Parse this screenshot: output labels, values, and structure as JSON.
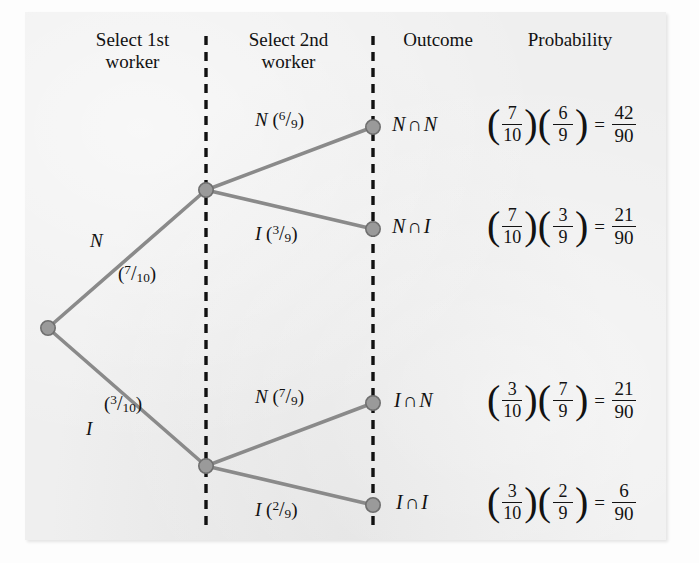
{
  "figure": {
    "type": "probability-tree-diagram",
    "headers": [
      {
        "id": "select-1st-worker",
        "line1": "Select 1st",
        "line2": "worker"
      },
      {
        "id": "select-2nd-worker",
        "line1": "Select 2nd",
        "line2": "worker"
      },
      {
        "id": "outcome",
        "line1": "Outcome",
        "line2": ""
      },
      {
        "id": "probability",
        "line1": "Probability",
        "line2": ""
      }
    ],
    "colors": {
      "panel_background": "#efefef",
      "page_background": "#fdfdfd",
      "branch_line": "#8a8a8a",
      "node_fill": "#9a9a9a",
      "node_stroke": "#6f6f6f",
      "divider": "#111111",
      "text": "#121212"
    },
    "dividers": [
      {
        "id": "divider-1",
        "x": 206,
        "style": "dashed"
      },
      {
        "id": "divider-2",
        "x": 373,
        "style": "dashed"
      }
    ],
    "nodes": [
      {
        "id": "root",
        "x": 48,
        "y": 328
      },
      {
        "id": "lvl1-n",
        "x": 206,
        "y": 190
      },
      {
        "id": "lvl1-i",
        "x": 206,
        "y": 466
      },
      {
        "id": "leaf-nn",
        "x": 373,
        "y": 127
      },
      {
        "id": "leaf-ni",
        "x": 373,
        "y": 229
      },
      {
        "id": "leaf-in",
        "x": 373,
        "y": 403
      },
      {
        "id": "leaf-ii",
        "x": 373,
        "y": 505
      }
    ],
    "branches": {
      "level1": [
        {
          "id": "branch-n",
          "event": "N",
          "prob_num": "7",
          "prob_den": "10",
          "from": "root",
          "to": "lvl1-n"
        },
        {
          "id": "branch-i",
          "event": "I",
          "prob_num": "3",
          "prob_den": "10",
          "from": "root",
          "to": "lvl1-i"
        }
      ],
      "level2": [
        {
          "id": "branch-n-n",
          "event": "N",
          "prob_num": "6",
          "prob_den": "9",
          "from": "lvl1-n",
          "to": "leaf-nn"
        },
        {
          "id": "branch-n-i",
          "event": "I",
          "prob_num": "3",
          "prob_den": "9",
          "from": "lvl1-n",
          "to": "leaf-ni"
        },
        {
          "id": "branch-i-n",
          "event": "N",
          "prob_num": "7",
          "prob_den": "9",
          "from": "lvl1-i",
          "to": "leaf-in"
        },
        {
          "id": "branch-i-i",
          "event": "I",
          "prob_num": "2",
          "prob_den": "9",
          "from": "lvl1-i",
          "to": "leaf-ii"
        }
      ]
    },
    "rows": [
      {
        "id": "row-nn",
        "outcome_first": "N",
        "outcome_op": "∩",
        "outcome_second": "N",
        "f1_num": "7",
        "f1_den": "10",
        "f2_num": "6",
        "f2_den": "9",
        "equals": "=",
        "result_num": "42",
        "result_den": "90"
      },
      {
        "id": "row-ni",
        "outcome_first": "N",
        "outcome_op": "∩",
        "outcome_second": "I",
        "f1_num": "7",
        "f1_den": "10",
        "f2_num": "3",
        "f2_den": "9",
        "equals": "=",
        "result_num": "21",
        "result_den": "90"
      },
      {
        "id": "row-in",
        "outcome_first": "I",
        "outcome_op": "∩",
        "outcome_second": "N",
        "f1_num": "3",
        "f1_den": "10",
        "f2_num": "7",
        "f2_den": "9",
        "equals": "=",
        "result_num": "21",
        "result_den": "90"
      },
      {
        "id": "row-ii",
        "outcome_first": "I",
        "outcome_op": "∩",
        "outcome_second": "I",
        "f1_num": "3",
        "f1_den": "10",
        "f2_num": "2",
        "f2_den": "9",
        "equals": "=",
        "result_num": "6",
        "result_den": "90"
      }
    ],
    "open_paren": "(",
    "close_paren": ")",
    "slash": "/"
  },
  "bleed_through": [
    "Problem: Note has hired ten new employees, three",
    "of whom are illegal aliens. Producing the interview",
    "of the workers, two are selected at random to begin",
    "probability that 0 or that 25 and later both have been",
    "",
    "then, compute the probabilities of these events.",
    "",
    "1. Both workers selected are illegal",
    "2. Neither worker selected is illegal",
    "",
    "In part a, we must compute the probability that both",
    "selected workers are illegal. Since there are 10",
    "workers, of whom are illegal, the probability that",
    "the first worker selected is illegal is 3/10, and after",
    "that worker has been selected the probability that",
    "the second"
  ]
}
